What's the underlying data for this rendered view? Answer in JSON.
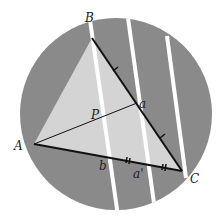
{
  "diagram": {
    "type": "geometry",
    "colors": {
      "background": "#ffffff",
      "disk": "#8a8a8a",
      "triangle_fill": "#d4d4d4",
      "strip": "#ffffff",
      "line": "#111111"
    },
    "labels": {
      "A": "A",
      "B": "B",
      "C": "C",
      "P": "P",
      "a": "a",
      "b": "b",
      "a_prime": "a'"
    }
  }
}
